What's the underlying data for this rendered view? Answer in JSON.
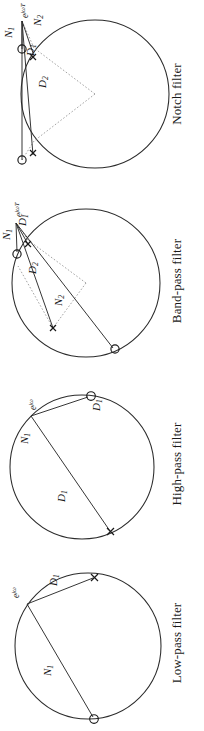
{
  "figure": {
    "orientation": "panels rotated 90 degrees counter-clockwise",
    "width": 204,
    "height": 731,
    "ink_color": "#1a1a1a",
    "circle_color": "#2b2b2b",
    "construction_color": "#8d8d8d"
  },
  "panels": [
    {
      "id": "notch",
      "caption": "Notch filter",
      "eval_point_label": "e",
      "eval_point_exponent": "jωT",
      "markers": [
        {
          "type": "zero",
          "glyph": "○",
          "name": "zero-left"
        },
        {
          "type": "zero",
          "glyph": "○",
          "name": "zero-right"
        },
        {
          "type": "pole",
          "glyph": "×",
          "name": "pole-left"
        },
        {
          "type": "pole",
          "glyph": "×",
          "name": "pole-right"
        }
      ],
      "vectors": [
        {
          "label": "N",
          "subscript": "1",
          "kind": "numerator"
        },
        {
          "label": "N",
          "subscript": "2",
          "kind": "numerator"
        },
        {
          "label": "D",
          "subscript": "1",
          "kind": "denominator"
        },
        {
          "label": "D",
          "subscript": "2",
          "kind": "denominator"
        }
      ]
    },
    {
      "id": "band-pass",
      "caption": "Band-pass filter",
      "eval_point_label": "e",
      "eval_point_exponent": "jωT",
      "markers": [
        {
          "type": "zero",
          "glyph": "○",
          "name": "zero-upper-right"
        },
        {
          "type": "zero",
          "glyph": "○",
          "name": "zero-bottom"
        },
        {
          "type": "pole",
          "glyph": "×",
          "name": "pole-left"
        },
        {
          "type": "pole",
          "glyph": "×",
          "name": "pole-right"
        }
      ],
      "vectors": [
        {
          "label": "N",
          "subscript": "1",
          "kind": "numerator"
        },
        {
          "label": "N",
          "subscript": "2",
          "kind": "numerator"
        },
        {
          "label": "D",
          "subscript": "1",
          "kind": "denominator"
        },
        {
          "label": "D",
          "subscript": "2",
          "kind": "denominator"
        }
      ]
    },
    {
      "id": "high-pass",
      "caption": "High-pass filter",
      "eval_point_label": "e",
      "eval_point_exponent": "jω",
      "markers": [
        {
          "type": "zero",
          "glyph": "○",
          "name": "zero-top"
        },
        {
          "type": "pole",
          "glyph": "×",
          "name": "pole-bottom"
        }
      ],
      "vectors": [
        {
          "label": "N",
          "subscript": "1",
          "kind": "numerator"
        },
        {
          "label": "D",
          "subscript": "1",
          "kind": "denominator"
        }
      ]
    },
    {
      "id": "low-pass",
      "caption": "Low-pass filter",
      "eval_point_label": "e",
      "eval_point_exponent": "jω",
      "markers": [
        {
          "type": "zero",
          "glyph": "○",
          "name": "zero-bottom"
        },
        {
          "type": "pole",
          "glyph": "×",
          "name": "pole-right"
        }
      ],
      "vectors": [
        {
          "label": "N",
          "subscript": "1",
          "kind": "numerator"
        },
        {
          "label": "D",
          "subscript": "1",
          "kind": "denominator"
        }
      ]
    }
  ]
}
